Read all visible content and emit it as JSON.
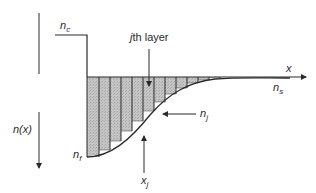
{
  "diagram": {
    "type": "graded-index refractive profile discretized into layers",
    "labels": {
      "n_c": {
        "base": "n",
        "sub": "c"
      },
      "jth_layer": {
        "italic": "j",
        "rest": "th layer"
      },
      "x_axis": "x",
      "n_s": {
        "base": "n",
        "sub": "s"
      },
      "n_x": "n(x)",
      "n_j": {
        "base": "n",
        "sub": "j"
      },
      "n_f": {
        "base": "n",
        "sub": "f"
      },
      "x_j": {
        "base": "x",
        "sub": "j"
      }
    },
    "colors": {
      "line": "#2a2a2a",
      "fill": "#bdbdbd",
      "background": "#ffffff"
    },
    "layer_count": 12
  }
}
